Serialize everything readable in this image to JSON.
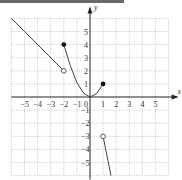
{
  "chart_data": {
    "type": "line",
    "title": "",
    "xlabel": "x",
    "ylabel": "y",
    "xlim": [
      -6,
      6
    ],
    "ylim": [
      -6,
      6
    ],
    "grid": true,
    "x_ticks": [
      "-5",
      "-4",
      "-3",
      "-2",
      "-1",
      "0",
      "1",
      "2",
      "3",
      "4",
      "5"
    ],
    "y_ticks": [
      "5",
      "4",
      "3",
      "2",
      "1",
      "-1",
      "-2",
      "-3",
      "-4",
      "-5"
    ],
    "series": [
      {
        "name": "segment-left",
        "kind": "line",
        "points": [
          [
            -6,
            6
          ],
          [
            -2,
            2
          ]
        ],
        "endpoints": {
          "start": "none",
          "end": "open"
        }
      },
      {
        "name": "curve-middle",
        "kind": "curve",
        "points": [
          [
            -2,
            4
          ],
          [
            -1.5,
            2.4
          ],
          [
            -1,
            1.1
          ],
          [
            -0.5,
            0.3
          ],
          [
            0,
            0
          ],
          [
            0.5,
            0.25
          ],
          [
            1,
            1
          ]
        ],
        "endpoints": {
          "start": "closed",
          "end": "closed"
        }
      },
      {
        "name": "segment-right",
        "kind": "line",
        "points": [
          [
            1,
            -3
          ],
          [
            1.6,
            -6
          ]
        ],
        "endpoints": {
          "start": "open",
          "end": "none"
        }
      }
    ],
    "colors": {
      "curve": "#444444",
      "grid": "#9a9a9a",
      "axis": "#222222"
    }
  },
  "labels": {
    "x_axis": "x",
    "y_axis": "y",
    "origin": "0"
  }
}
